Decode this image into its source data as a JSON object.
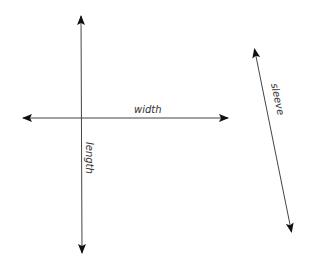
{
  "diagram": {
    "colors": {
      "line": "#444444",
      "arrowhead": "#111111",
      "text": "#333333",
      "background": "#ffffff"
    },
    "measurements": [
      {
        "id": "length",
        "label": "length",
        "orientation": "vertical",
        "from": [
          81,
          14
        ],
        "to": [
          82,
          255
        ]
      },
      {
        "id": "width",
        "label": "width",
        "orientation": "horizontal",
        "from": [
          21,
          118
        ],
        "to": [
          230,
          118
        ]
      },
      {
        "id": "sleeve",
        "label": "sleeve",
        "orientation": "diagonal",
        "from": [
          254,
          47
        ],
        "to": [
          292,
          234
        ]
      }
    ]
  }
}
